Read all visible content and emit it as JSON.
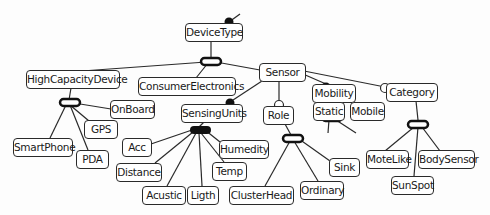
{
  "diagram": {
    "type": "feature-model",
    "colors": {
      "line": "#2a2a2a",
      "box_border": "#2a2a2a",
      "box_fill": "#ffffff",
      "mandatory": "#111111",
      "optional_fill": "#ffffff"
    },
    "nodes": {
      "DeviceType": "DeviceType",
      "HighCapacityDevice": "HighCapacityDevice",
      "ConsumerElectronics": "ConsumerElectronics",
      "Sensor": "Sensor",
      "OnBoard": "OnBoard",
      "GPS": "GPS",
      "SmartPhone": "SmartPhone",
      "PDA": "PDA",
      "SensingUnits": "SensingUnits",
      "Acc": "Acc",
      "Distance": "Distance",
      "Acustic": "Acustic",
      "Ligth": "Ligth",
      "Humedity": "Humedity",
      "Temp": "Temp",
      "Role": "Role",
      "ClusterHead": "ClusterHead",
      "Ordinary": "Ordinary",
      "Sink": "Sink",
      "Mobility": "Mobility",
      "Static": "Static",
      "Mobile": "Mobile",
      "Category": "Category",
      "MoteLike": "MoteLike",
      "BodySensor": "BodySensor",
      "SunSpot": "SunSpot"
    },
    "relations": [
      {
        "parent": "DeviceType",
        "group": "alternative",
        "children": [
          "HighCapacityDevice",
          "ConsumerElectronics",
          "Sensor"
        ]
      },
      {
        "parent": "HighCapacityDevice",
        "group": "alternative",
        "children": [
          "OnBoard",
          "GPS",
          "SmartPhone",
          "PDA"
        ]
      },
      {
        "parent": "Sensor",
        "kind": "mandatory",
        "child": "SensingUnits"
      },
      {
        "parent": "Sensor",
        "kind": "optional",
        "child": "Role"
      },
      {
        "parent": "Sensor",
        "kind": "mandatory",
        "child": "Mobility"
      },
      {
        "parent": "Sensor",
        "kind": "optional",
        "child": "Category"
      },
      {
        "parent": "SensingUnits",
        "group": "or",
        "children": [
          "Acc",
          "Distance",
          "Acustic",
          "Ligth",
          "Temp",
          "Humedity"
        ]
      },
      {
        "parent": "Role",
        "group": "alternative",
        "children": [
          "ClusterHead",
          "Ordinary",
          "Sink"
        ]
      },
      {
        "parent": "Mobility",
        "group": "alternative",
        "children": [
          "Static",
          "Mobile"
        ]
      },
      {
        "parent": "Category",
        "group": "alternative",
        "children": [
          "MoteLike",
          "SunSpot",
          "BodySensor"
        ]
      }
    ]
  }
}
